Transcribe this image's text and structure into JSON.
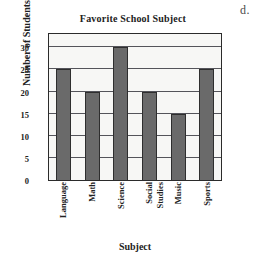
{
  "option_marker": "d.",
  "chart_data": {
    "type": "bar",
    "title": "Favorite School Subject",
    "xlabel": "Subject",
    "ylabel": "Number of Students",
    "categories": [
      "Language",
      "Math",
      "Science",
      "Social Studies",
      "Music",
      "Sports"
    ],
    "category_lines": [
      [
        "Language"
      ],
      [
        "Math"
      ],
      [
        "Science"
      ],
      [
        "Social",
        "Studies"
      ],
      [
        "Music"
      ],
      [
        "Sports"
      ]
    ],
    "values": [
      25,
      20,
      30,
      20,
      15,
      25
    ],
    "ylim": [
      0,
      33
    ],
    "yticks": [
      0,
      5,
      10,
      15,
      20,
      25,
      30
    ],
    "ytick_labels": [
      "0",
      "5",
      "10",
      "15",
      "20",
      "25",
      "30"
    ],
    "grid": true,
    "grid_axis": "y",
    "legend": false,
    "bar_color": "#6a6a6a",
    "bar_edge_color": "#2e2e2e",
    "plot_background": "#f7f7f5",
    "frame_color": "#2b2b2b",
    "gridline_color": "#54545a"
  }
}
